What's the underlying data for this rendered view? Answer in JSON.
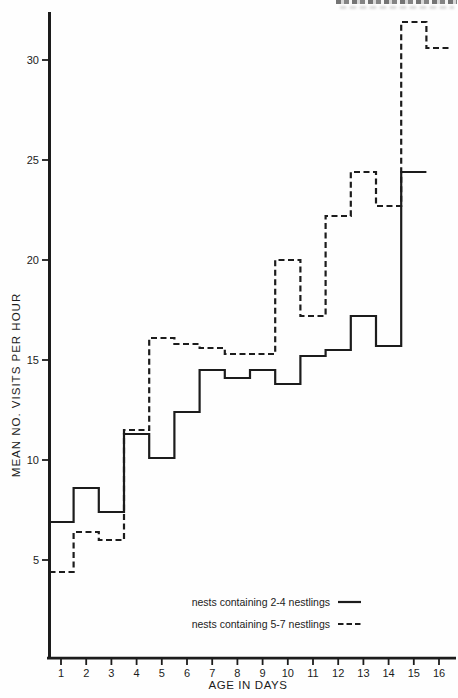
{
  "chart_data": {
    "type": "line",
    "subtype": "step",
    "title": "",
    "xlabel": "AGE IN DAYS",
    "ylabel": "MEAN NO. VISITS PER HOUR",
    "x_ticks": [
      1,
      2,
      3,
      4,
      5,
      6,
      7,
      8,
      9,
      10,
      11,
      12,
      13,
      14,
      15,
      16
    ],
    "y_ticks": [
      5,
      10,
      15,
      20,
      25,
      30
    ],
    "xlim": [
      0.55,
      16.8
    ],
    "ylim": [
      0,
      32.4
    ],
    "grid": false,
    "legend_position": "inside-bottom-right",
    "ink_color": "#1c1c1c",
    "series": [
      {
        "name": "nests containing 2-4 nestlings",
        "line_style": "solid",
        "color": "#1c1c1c",
        "x": [
          1,
          2,
          3,
          4,
          5,
          6,
          7,
          8,
          9,
          10,
          11,
          12,
          13,
          14,
          15
        ],
        "values": [
          6.9,
          8.6,
          7.4,
          11.3,
          10.1,
          12.4,
          14.5,
          14.1,
          14.5,
          13.8,
          15.2,
          15.5,
          17.2,
          15.7,
          24.4
        ]
      },
      {
        "name": "nests containing 5-7 nestlings",
        "line_style": "dashed",
        "color": "#1c1c1c",
        "x": [
          1,
          2,
          3,
          4,
          5,
          6,
          7,
          8,
          9,
          10,
          11,
          12,
          13,
          14,
          15,
          16
        ],
        "values": [
          4.4,
          6.4,
          6.0,
          11.5,
          16.1,
          15.8,
          15.6,
          15.3,
          15.3,
          20.0,
          17.2,
          22.2,
          24.4,
          22.7,
          31.9,
          30.6
        ]
      }
    ]
  }
}
